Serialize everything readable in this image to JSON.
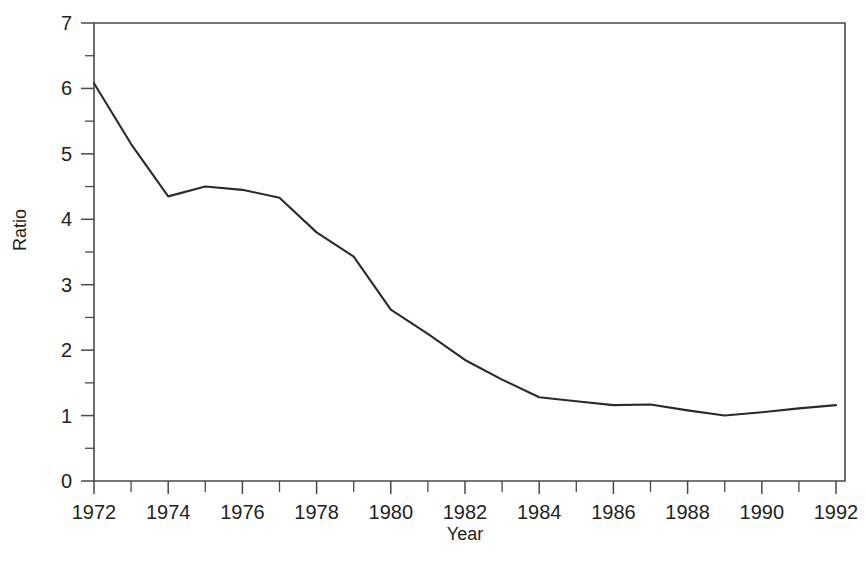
{
  "chart_data": {
    "type": "line",
    "title": "",
    "xlabel": "Year",
    "ylabel": "Ratio",
    "xlim": [
      1972,
      1992
    ],
    "ylim": [
      0,
      7
    ],
    "grid": false,
    "legend": null,
    "x": [
      1972,
      1973,
      1974,
      1975,
      1976,
      1977,
      1978,
      1979,
      1980,
      1981,
      1982,
      1983,
      1984,
      1985,
      1986,
      1987,
      1988,
      1989,
      1990,
      1991,
      1992
    ],
    "values": [
      6.08,
      5.15,
      4.35,
      4.5,
      4.45,
      4.33,
      3.8,
      3.43,
      2.62,
      2.25,
      1.85,
      1.55,
      1.28,
      1.22,
      1.16,
      1.17,
      1.08,
      1.0,
      1.05,
      1.11,
      1.16
    ],
    "series": [
      {
        "name": "Ratio",
        "color": "#2b2b2b",
        "values": [
          6.08,
          5.15,
          4.35,
          4.5,
          4.45,
          4.33,
          3.8,
          3.43,
          2.62,
          2.25,
          1.85,
          1.55,
          1.28,
          1.22,
          1.16,
          1.17,
          1.08,
          1.0,
          1.05,
          1.11,
          1.16
        ]
      }
    ],
    "y_ticks": [
      0,
      1,
      2,
      3,
      4,
      5,
      6,
      7
    ],
    "y_tick_labels": [
      "0",
      "1",
      "2",
      "3",
      "4",
      "5",
      "6",
      "7"
    ],
    "y_minor_ticks": [
      0.5,
      1.5,
      2.5,
      3.5,
      4.5,
      5.5,
      6.5
    ],
    "x_ticks": [
      1972,
      1973,
      1974,
      1975,
      1976,
      1977,
      1978,
      1979,
      1980,
      1981,
      1982,
      1983,
      1984,
      1985,
      1986,
      1987,
      1988,
      1989,
      1990,
      1991,
      1992
    ],
    "x_tick_labels": [
      "1972",
      "",
      "1974",
      "",
      "1976",
      "",
      "1978",
      "",
      "1980",
      "",
      "1982",
      "",
      "1984",
      "",
      "1986",
      "",
      "1988",
      "",
      "1990",
      "",
      "1992"
    ],
    "x_labeled_ticks": [
      1972,
      1974,
      1976,
      1978,
      1980,
      1982,
      1984,
      1986,
      1988,
      1990,
      1992
    ],
    "x_labeled_text": [
      "1972",
      "1974",
      "1976",
      "1978",
      "1980",
      "1982",
      "1984",
      "1986",
      "1988",
      "1990",
      "1992"
    ]
  },
  "colors": {
    "background": "#ffffff",
    "axis": "#4a4a4a",
    "line": "#2b2b2b",
    "text": "#231f20"
  }
}
